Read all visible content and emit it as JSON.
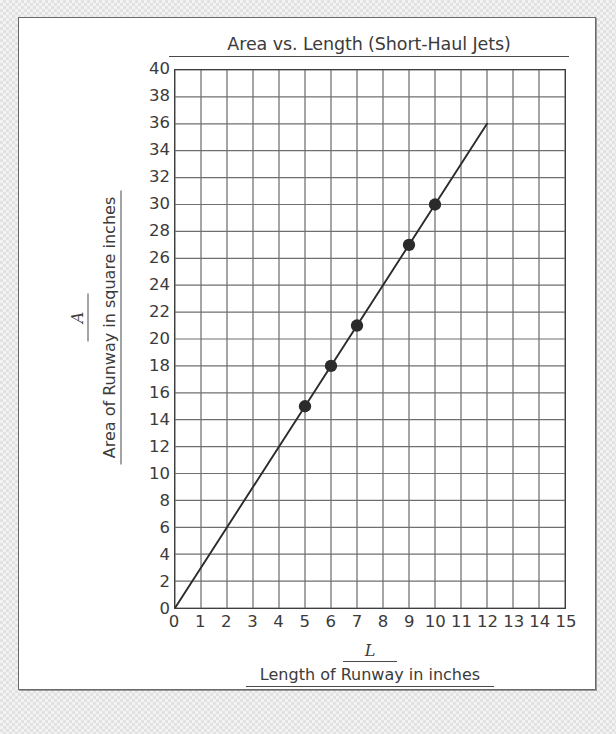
{
  "chart_data": {
    "type": "scatter",
    "title": "Area vs. Length (Short-Haul Jets)",
    "xlabel": "Length of Runway in inches",
    "xvar": "L",
    "ylabel": "Area of Runway in square inches",
    "yvar": "A",
    "xlim": [
      0,
      15
    ],
    "ylim": [
      0,
      40
    ],
    "xticks": [
      "0",
      "1",
      "2",
      "3",
      "4",
      "5",
      "6",
      "7",
      "8",
      "9",
      "10",
      "11",
      "12",
      "13",
      "14",
      "15"
    ],
    "yticks": [
      "0",
      "2",
      "4",
      "6",
      "8",
      "10",
      "12",
      "14",
      "16",
      "18",
      "20",
      "22",
      "24",
      "26",
      "28",
      "30",
      "32",
      "34",
      "36",
      "38",
      "40"
    ],
    "xtick_step": 1,
    "ytick_step": 2,
    "grid": true,
    "grid_x_step": 1,
    "grid_y_step": 2,
    "legend": false,
    "points": [
      {
        "x": 5,
        "y": 15
      },
      {
        "x": 6,
        "y": 18
      },
      {
        "x": 7,
        "y": 21
      },
      {
        "x": 9,
        "y": 27
      },
      {
        "x": 10,
        "y": 30
      }
    ],
    "trend_line": {
      "slope": 3,
      "intercept": 0,
      "x_start": 0,
      "y_start": 0,
      "x_end": 12,
      "y_end": 36
    },
    "colors": {
      "ink": "#3b3b3b",
      "grid": "#6f6f6f",
      "axis": "#3f3f3f",
      "marker": "#2b2b2b",
      "paper": "#ffffff"
    }
  }
}
